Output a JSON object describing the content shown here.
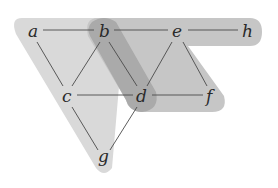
{
  "diagram": {
    "type": "hypergraph",
    "nodes": [
      {
        "id": "a",
        "label": "a",
        "x": 33,
        "y": 32
      },
      {
        "id": "b",
        "label": "b",
        "x": 104,
        "y": 32
      },
      {
        "id": "e",
        "label": "e",
        "x": 177,
        "y": 32
      },
      {
        "id": "h",
        "label": "h",
        "x": 248,
        "y": 32
      },
      {
        "id": "c",
        "label": "c",
        "x": 67,
        "y": 97
      },
      {
        "id": "d",
        "label": "d",
        "x": 142,
        "y": 97
      },
      {
        "id": "f",
        "label": "f",
        "x": 211,
        "y": 97
      },
      {
        "id": "g",
        "label": "g",
        "x": 103,
        "y": 157
      }
    ],
    "edges": [
      [
        "a",
        "b"
      ],
      [
        "b",
        "e"
      ],
      [
        "e",
        "h"
      ],
      [
        "a",
        "c"
      ],
      [
        "b",
        "c"
      ],
      [
        "b",
        "d"
      ],
      [
        "e",
        "d"
      ],
      [
        "e",
        "f"
      ],
      [
        "c",
        "d"
      ],
      [
        "d",
        "f"
      ],
      [
        "c",
        "g"
      ],
      [
        "d",
        "g"
      ]
    ],
    "hyperedges": [
      {
        "name": "left-triangle",
        "members": [
          "a",
          "b",
          "c",
          "d",
          "g"
        ],
        "color": "#d9d9d9"
      },
      {
        "name": "right-band",
        "members": [
          "b",
          "e",
          "h",
          "d",
          "f"
        ],
        "color": "#c4c4c4"
      },
      {
        "name": "overlap-bd",
        "members": [
          "b",
          "d"
        ],
        "color": "#a8a8a8"
      }
    ]
  }
}
